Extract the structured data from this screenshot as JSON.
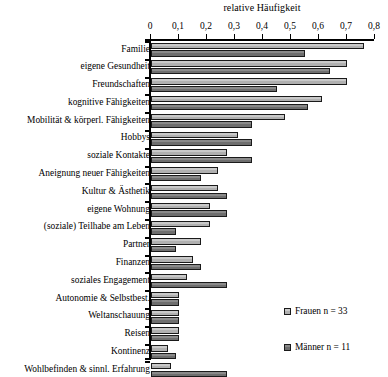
{
  "chart_data": {
    "type": "bar",
    "orientation": "horizontal",
    "title": "relative Häufigkeit",
    "xlabel": "relative Häufigkeit",
    "ylabel": "",
    "xlim": [
      0,
      0.8
    ],
    "grid": false,
    "legend_position": "bottom-right",
    "xticks": [
      "0",
      "0,1",
      "0,2",
      "0,3",
      "0,4",
      "0,5",
      "0,6",
      "0,7",
      "0,8"
    ],
    "xtick_values": [
      0,
      0.1,
      0.2,
      0.3,
      0.4,
      0.5,
      0.6,
      0.7,
      0.8
    ],
    "categories": [
      "Familie",
      "eigene Gesundheit",
      "Freundschaften",
      "kognitive Fähigkeiten",
      "Mobilität & körperl. Fähigkeiten",
      "Hobbys",
      "soziale Kontakte",
      "Aneignung neuer Fähigkeiten",
      "Kultur & Ästhetik",
      "eigene Wohnung",
      "(soziale) Teilhabe am Leben",
      "Partner",
      "Finanzen",
      "soziales Engagement",
      "Autonomie & Selbstbest.",
      "Weltanschauung",
      "Reisen",
      "Kontinenz",
      "Wohlbefinden & sinnl. Erfahrung"
    ],
    "series": [
      {
        "name": "Frauen n = 33",
        "color": "#c0c0c0",
        "values": [
          0.76,
          0.7,
          0.7,
          0.61,
          0.48,
          0.31,
          0.27,
          0.24,
          0.24,
          0.21,
          0.21,
          0.18,
          0.15,
          0.13,
          0.1,
          0.1,
          0.1,
          0.06,
          0.07
        ]
      },
      {
        "name": "Männer n = 11",
        "color": "#777777",
        "values": [
          0.55,
          0.64,
          0.45,
          0.56,
          0.36,
          0.36,
          0.36,
          0.18,
          0.27,
          0.27,
          0.09,
          0.09,
          0.18,
          0.27,
          0.1,
          0.1,
          0.1,
          0.09,
          0.27
        ]
      }
    ]
  },
  "legend": {
    "items": [
      {
        "label": "Frauen n = 33"
      },
      {
        "label": "Männer n = 11"
      }
    ]
  }
}
